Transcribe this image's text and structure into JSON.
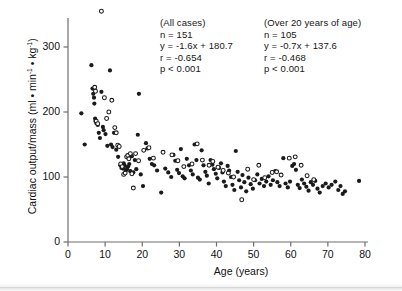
{
  "figure": {
    "title": "",
    "background_color": "#ffffff",
    "ink_color": "#1a1a1a"
  },
  "axes": {
    "x_label": "Age (years)",
    "y_label_text": "Cardiac output/mass (ml • min",
    "y_label_sup1": "-1",
    "y_label_mid": " • kg",
    "y_label_sup2": "-1",
    "y_label_end": ")",
    "x_ticks": [
      "0",
      "10",
      "20",
      "30",
      "40",
      "50",
      "60",
      "70",
      "80"
    ],
    "y_ticks": [
      "0",
      "100",
      "200",
      "300"
    ]
  },
  "annotations": {
    "all_cases": {
      "header": "(All cases)",
      "n": "n = 151",
      "equation": "y = -1.6x + 180.7",
      "r": "r = -0.654",
      "p": "p < 0.001"
    },
    "over_20": {
      "header": "(Over 20 years of age)",
      "n": "n = 105",
      "equation": "y = -0.7x + 137.6",
      "r": "r = -0.468",
      "p": "p < 0.001"
    }
  },
  "chart_data": {
    "type": "scatter",
    "title": "",
    "xlabel": "Age (years)",
    "ylabel": "Cardiac output/mass (ml • min^-1 • kg^-1)",
    "xlim": [
      0,
      80
    ],
    "ylim": [
      0,
      360
    ],
    "xticks": [
      0,
      10,
      20,
      30,
      40,
      50,
      60,
      70,
      80
    ],
    "yticks": [
      0,
      100,
      200,
      300
    ],
    "grid": false,
    "legend": "none",
    "marker_size_px": 4.2,
    "regressions": [
      {
        "name": "All cases",
        "n": 151,
        "slope": -1.6,
        "intercept": 180.7,
        "r": -0.654,
        "p": "<0.001",
        "drawn": false
      },
      {
        "name": "Over 20 years of age",
        "n": 105,
        "slope": -0.7,
        "intercept": 137.6,
        "r": -0.468,
        "p": "<0.001",
        "drawn": false
      }
    ],
    "series": [
      {
        "name": "closed-circles",
        "marker": "filled-circle",
        "color": "#1a1a1a",
        "points": [
          [
            3.6,
            198
          ],
          [
            4.5,
            150
          ],
          [
            6.3,
            272
          ],
          [
            6.6,
            236
          ],
          [
            6.8,
            228
          ],
          [
            7.0,
            222
          ],
          [
            7.1,
            213
          ],
          [
            7.3,
            190
          ],
          [
            7.4,
            186
          ],
          [
            7.6,
            183
          ],
          [
            8.0,
            180
          ],
          [
            8.3,
            168
          ],
          [
            8.6,
            160
          ],
          [
            9.0,
            231
          ],
          [
            9.4,
            177
          ],
          [
            9.6,
            172
          ],
          [
            10.1,
            166
          ],
          [
            10.6,
            148
          ],
          [
            11.3,
            264
          ],
          [
            11.6,
            150
          ],
          [
            12.0,
            146
          ],
          [
            12.4,
            168
          ],
          [
            13.0,
            142
          ],
          [
            13.5,
            131
          ],
          [
            14.1,
            118
          ],
          [
            14.4,
            114
          ],
          [
            14.8,
            113
          ],
          [
            15.0,
            121
          ],
          [
            15.3,
            117
          ],
          [
            15.6,
            110
          ],
          [
            15.9,
            112
          ],
          [
            16.2,
            116
          ],
          [
            16.5,
            120
          ],
          [
            16.8,
            109
          ],
          [
            17.2,
            132
          ],
          [
            17.6,
            107
          ],
          [
            18.0,
            126
          ],
          [
            18.4,
            112
          ],
          [
            18.8,
            165
          ],
          [
            19.1,
            228
          ],
          [
            19.6,
            104
          ],
          [
            20.2,
            86
          ],
          [
            21.0,
            152
          ],
          [
            21.4,
            144
          ],
          [
            22.0,
            128
          ],
          [
            22.6,
            120
          ],
          [
            23.2,
            118
          ],
          [
            24.0,
            110
          ],
          [
            25.1,
            76
          ],
          [
            26.2,
            113
          ],
          [
            27.0,
            107
          ],
          [
            27.8,
            100
          ],
          [
            28.4,
            134
          ],
          [
            28.9,
            125
          ],
          [
            29.4,
            111
          ],
          [
            29.9,
            106
          ],
          [
            30.4,
            143
          ],
          [
            30.9,
            101
          ],
          [
            31.4,
            98
          ],
          [
            32.0,
            128
          ],
          [
            32.6,
            118
          ],
          [
            33.1,
            110
          ],
          [
            33.6,
            104
          ],
          [
            34.1,
            150
          ],
          [
            34.6,
            126
          ],
          [
            35.0,
            99
          ],
          [
            35.5,
            96
          ],
          [
            36.0,
            141
          ],
          [
            36.5,
            118
          ],
          [
            37.0,
            108
          ],
          [
            37.4,
            102
          ],
          [
            37.9,
            90
          ],
          [
            38.4,
            126
          ],
          [
            38.9,
            119
          ],
          [
            39.3,
            112
          ],
          [
            39.8,
            105
          ],
          [
            40.2,
            98
          ],
          [
            40.7,
            114
          ],
          [
            41.2,
            121
          ],
          [
            41.6,
            107
          ],
          [
            42.0,
            93
          ],
          [
            42.5,
            86
          ],
          [
            43.0,
            117
          ],
          [
            43.4,
            110
          ],
          [
            43.9,
            100
          ],
          [
            44.3,
            88
          ],
          [
            44.8,
            80
          ],
          [
            45.2,
            140
          ],
          [
            45.7,
            108
          ],
          [
            46.1,
            95
          ],
          [
            46.6,
            84
          ],
          [
            47.0,
            103
          ],
          [
            47.5,
            92
          ],
          [
            48.0,
            78
          ],
          [
            48.6,
            99
          ],
          [
            49.2,
            89
          ],
          [
            49.8,
            82
          ],
          [
            50.4,
            95
          ],
          [
            51.0,
            104
          ],
          [
            51.6,
            90
          ],
          [
            52.2,
            97
          ],
          [
            52.8,
            86
          ],
          [
            53.4,
            93
          ],
          [
            54.0,
            101
          ],
          [
            54.6,
            88
          ],
          [
            55.2,
            95
          ],
          [
            55.8,
            109
          ],
          [
            56.4,
            92
          ],
          [
            57.0,
            86
          ],
          [
            58.0,
            129
          ],
          [
            58.6,
            90
          ],
          [
            59.2,
            84
          ],
          [
            59.8,
            93
          ],
          [
            60.4,
            117
          ],
          [
            60.9,
            120
          ],
          [
            61.4,
            111
          ],
          [
            61.9,
            88
          ],
          [
            62.4,
            83
          ],
          [
            63.0,
            96
          ],
          [
            63.6,
            90
          ],
          [
            64.2,
            85
          ],
          [
            64.8,
            79
          ],
          [
            65.4,
            92
          ],
          [
            66.0,
            88
          ],
          [
            66.6,
            94
          ],
          [
            67.2,
            82
          ],
          [
            67.8,
            76
          ],
          [
            68.6,
            86
          ],
          [
            69.4,
            90
          ],
          [
            70.2,
            84
          ],
          [
            71.0,
            88
          ],
          [
            72.0,
            93
          ],
          [
            72.8,
            80
          ],
          [
            73.4,
            86
          ],
          [
            74.0,
            74
          ],
          [
            74.6,
            78
          ],
          [
            78.4,
            94
          ]
        ]
      },
      {
        "name": "open-circles",
        "marker": "open-circle",
        "color": "#1a1a1a",
        "points": [
          [
            9.0,
            355
          ],
          [
            7.2,
            238
          ],
          [
            7.4,
            232
          ],
          [
            7.6,
            186
          ],
          [
            8.0,
            182
          ],
          [
            9.8,
            222
          ],
          [
            10.4,
            190
          ],
          [
            11.0,
            200
          ],
          [
            11.8,
            218
          ],
          [
            12.6,
            176
          ],
          [
            13.0,
            168
          ],
          [
            13.4,
            149
          ],
          [
            13.8,
            147
          ],
          [
            14.2,
            120
          ],
          [
            14.6,
            116
          ],
          [
            15.0,
            104
          ],
          [
            15.4,
            106
          ],
          [
            15.8,
            131
          ],
          [
            16.1,
            133
          ],
          [
            16.4,
            128
          ],
          [
            16.8,
            136
          ],
          [
            17.2,
            105
          ],
          [
            17.6,
            83
          ],
          [
            18.2,
            136
          ],
          [
            19.0,
            125
          ],
          [
            20.4,
            141
          ],
          [
            21.8,
            145
          ],
          [
            23.0,
            129
          ],
          [
            25.6,
            138
          ],
          [
            28.0,
            134
          ],
          [
            29.6,
            125
          ],
          [
            31.2,
            116
          ],
          [
            33.4,
            120
          ],
          [
            34.8,
            151
          ],
          [
            36.2,
            126
          ],
          [
            38.0,
            118
          ],
          [
            39.0,
            124
          ],
          [
            40.4,
            115
          ],
          [
            41.8,
            110
          ],
          [
            43.2,
            106
          ],
          [
            44.6,
            100
          ],
          [
            46.8,
            65
          ],
          [
            48.4,
            112
          ],
          [
            50.0,
            96
          ],
          [
            51.4,
            118
          ],
          [
            53.0,
            99
          ],
          [
            55.0,
            107
          ],
          [
            56.2,
            108
          ],
          [
            57.4,
            103
          ],
          [
            59.6,
            129
          ],
          [
            61.2,
            131
          ],
          [
            62.8,
            118
          ],
          [
            64.4,
            102
          ],
          [
            66.2,
            96
          ]
        ]
      }
    ]
  }
}
